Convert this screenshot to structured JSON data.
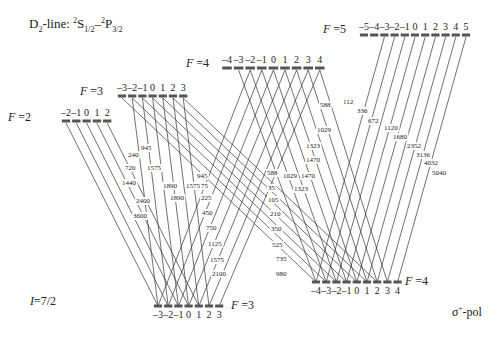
{
  "title": {
    "prefix": "D",
    "prefix_sub": "2",
    "middle": "-line: ",
    "s_sup": "2",
    "s_letter": "S",
    "s_sub": "1/2",
    "dash": "–",
    "p_sup": "2",
    "p_letter": "P",
    "p_sub": "3/2"
  },
  "nuclear_spin": {
    "symbol": "I",
    "value": "=7/2"
  },
  "polarization": {
    "symbol": "σ",
    "sup": "+",
    "suffix": "-pol"
  },
  "excited_levels": [
    {
      "name": "F=2",
      "F": 2,
      "label_symbol": "F",
      "label_value": "=2",
      "label_x": 8,
      "label_y": 110,
      "bar_y": 121,
      "x0": 66,
      "dx": 10.3,
      "mF": [
        "–2",
        "–1",
        "0",
        "1",
        "2"
      ]
    },
    {
      "name": "F=3",
      "F": 3,
      "label_symbol": "F",
      "label_value": "=3",
      "label_x": 80,
      "label_y": 84,
      "bar_y": 96,
      "x0": 122,
      "dx": 10.2,
      "mF": [
        "–3",
        "–2",
        "–1",
        "0",
        "1",
        "2",
        "3"
      ]
    },
    {
      "name": "F=4",
      "F": 4,
      "label_symbol": "F",
      "label_value": "=4",
      "label_x": 186,
      "label_y": 56,
      "bar_y": 68,
      "x0": 227,
      "dx": 11.6,
      "mF": [
        "–4",
        "–3",
        "–2",
        "–1",
        "0",
        "1",
        "2",
        "3",
        "4"
      ]
    },
    {
      "name": "F=5",
      "F": 5,
      "label_symbol": "F",
      "label_value": "=5",
      "label_x": 323,
      "label_y": 22,
      "bar_y": 35,
      "x0": 364,
      "dx": 10.2,
      "mF": [
        "–5",
        "–4",
        "–3",
        "–2",
        "–1",
        "0",
        "1",
        "2",
        "3",
        "4",
        "5"
      ]
    }
  ],
  "ground_levels": [
    {
      "name": "F=3",
      "F": 3,
      "label_symbol": "F",
      "label_value": "=3",
      "label_x": 231,
      "label_y": 298,
      "bar_y": 306,
      "x0": 158,
      "dx": 10.2,
      "mF": [
        "–3",
        "–2",
        "–1",
        "0",
        "1",
        "2",
        "3"
      ]
    },
    {
      "name": "F=4",
      "F": 4,
      "label_symbol": "F",
      "label_value": "=4",
      "label_x": 405,
      "label_y": 274,
      "bar_y": 282,
      "x0": 316,
      "dx": 10.2,
      "mF": [
        "–4",
        "–3",
        "–2",
        "–1",
        "0",
        "1",
        "2",
        "3",
        "4"
      ]
    }
  ],
  "transitions": [
    {
      "from": "g3",
      "to": "e2",
      "strengths": [
        "3600",
        "2400",
        "1440",
        "720",
        "240"
      ],
      "label_pos": [
        [
          133,
          218
        ],
        [
          136,
          203
        ],
        [
          122,
          185
        ],
        [
          125,
          170
        ],
        [
          128,
          157
        ]
      ]
    },
    {
      "from": "g3",
      "to": "e3",
      "strengths": [
        "1890",
        "1890",
        "1575",
        "945"
      ],
      "label_pos": [
        [
          170,
          200
        ],
        [
          163,
          188
        ],
        [
          147,
          170
        ],
        [
          141,
          150
        ]
      ]
    },
    {
      "from": "g3",
      "to": "e3_b",
      "strengths": [
        "1575",
        "945"
      ],
      "label_pos": [
        [
          186,
          188
        ],
        [
          197,
          178
        ]
      ]
    },
    {
      "from": "g3",
      "to": "e4",
      "strengths": [
        "75",
        "225",
        "450",
        "750",
        "1125",
        "1575",
        "2100"
      ],
      "label_pos": [
        [
          201,
          188
        ],
        [
          201,
          200
        ],
        [
          202,
          215
        ],
        [
          206,
          230
        ],
        [
          208,
          246
        ],
        [
          210,
          262
        ],
        [
          212,
          276
        ]
      ]
    },
    {
      "from": "g4",
      "to": "e3",
      "strengths": [
        "35",
        "105",
        "210",
        "350",
        "525",
        "735",
        "980"
      ],
      "label_pos": [
        [
          268,
          190
        ],
        [
          268,
          202
        ],
        [
          270,
          216
        ],
        [
          271,
          231
        ],
        [
          272,
          247
        ],
        [
          276,
          261
        ],
        [
          276,
          276
        ]
      ]
    },
    {
      "from": "g4",
      "to": "e4",
      "strengths": [
        "588",
        "1029",
        "1470",
        "1323",
        "1470",
        "1323",
        "1029",
        "588"
      ],
      "label_pos": [
        [
          267,
          175
        ],
        [
          283,
          178
        ],
        [
          301,
          178
        ],
        [
          294,
          191
        ],
        [
          306,
          162
        ],
        [
          306,
          148
        ],
        [
          317,
          132
        ],
        [
          320,
          107
        ]
      ]
    },
    {
      "from": "g4",
      "to": "e5",
      "strengths": [
        "112",
        "336",
        "672",
        "1120",
        "1680",
        "2352",
        "3136",
        "4032",
        "5040"
      ],
      "label_pos": [
        [
          343,
          104
        ],
        [
          357,
          113
        ],
        [
          368,
          123
        ],
        [
          384,
          130
        ],
        [
          393,
          139
        ],
        [
          407,
          148
        ],
        [
          416,
          157
        ],
        [
          424,
          165
        ],
        [
          432,
          175
        ]
      ]
    }
  ]
}
